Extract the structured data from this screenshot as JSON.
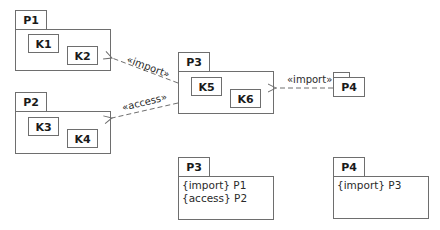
{
  "diagram": {
    "type": "uml-package-diagram",
    "packages": {
      "p1": {
        "name": "P1",
        "classes": [
          "K1",
          "K2"
        ]
      },
      "p2": {
        "name": "P2",
        "classes": [
          "K3",
          "K4"
        ]
      },
      "p3": {
        "name": "P3",
        "classes": [
          "K5",
          "K6"
        ]
      },
      "p4": {
        "name": "P4"
      }
    },
    "dependencies": [
      {
        "from": "P3",
        "to": "P1",
        "label": "«import»"
      },
      {
        "from": "P3",
        "to": "P2",
        "label": "«access»"
      },
      {
        "from": "P4",
        "to": "P3",
        "label": "«import»"
      }
    ],
    "summaries": [
      {
        "name": "P3",
        "lines": [
          "{import} P1",
          "{access} P2"
        ]
      },
      {
        "name": "P4",
        "lines": [
          "{import} P3"
        ]
      }
    ]
  }
}
